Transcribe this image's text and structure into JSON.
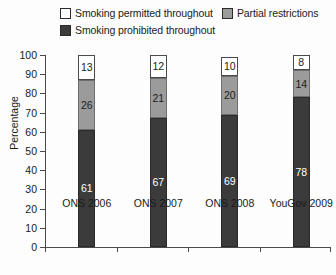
{
  "chart_data": {
    "type": "bar",
    "stacked": true,
    "title": "",
    "subtitle": "",
    "xlabel": "",
    "ylabel": "Percentage",
    "ylim": [
      0,
      100
    ],
    "ytick_step": 10,
    "yticks": [
      100,
      90,
      80,
      70,
      60,
      50,
      40,
      30,
      20,
      10,
      0
    ],
    "grid": false,
    "legend_position": "top",
    "categories": [
      "ONS 2006",
      "ONS 2007",
      "ONS 2008",
      "YouGov 2009"
    ],
    "series": [
      {
        "name": "Smoking permitted throughout",
        "color": "#ffffff",
        "values": [
          13,
          12,
          10,
          8
        ]
      },
      {
        "name": "Partial restrictions",
        "color": "#9b9b9b",
        "values": [
          26,
          21,
          20,
          14
        ]
      },
      {
        "name": "Smoking prohibited throughout",
        "color": "#3b3b3b",
        "values": [
          61,
          67,
          69,
          78
        ]
      }
    ]
  },
  "legend": {
    "rows": [
      [
        {
          "label": "Smoking permitted throughout",
          "swatch": "#ffffff"
        },
        {
          "label": "Partial restrictions",
          "swatch": "#9b9b9b"
        }
      ],
      [
        {
          "label": "Smoking prohibited throughout",
          "swatch": "#3b3b3b"
        }
      ]
    ]
  }
}
